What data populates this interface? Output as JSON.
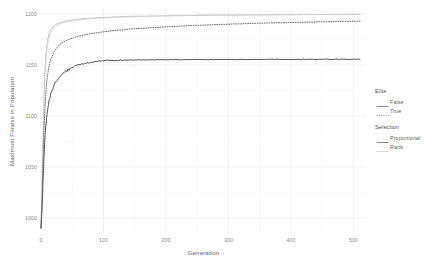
{
  "chart_data": {
    "type": "line",
    "title": "",
    "xlabel": "Generation",
    "ylabel": "Maximum Fitness in Population",
    "xlim": [
      0,
      520
    ],
    "ylim": [
      985,
      1205
    ],
    "xticks": [
      0,
      100,
      200,
      300,
      400,
      500
    ],
    "yticks": [
      1000,
      1050,
      1100,
      1150,
      1200
    ],
    "grid": true,
    "legend_position": "right",
    "legends": [
      {
        "title": "Elite",
        "entries": [
          {
            "label": "False",
            "style": "solid"
          },
          {
            "label": "True",
            "style": "dotted"
          }
        ]
      },
      {
        "title": "Selection",
        "entries": [
          {
            "label": "Proportional",
            "color": "#7a7a7a"
          },
          {
            "label": "Rank",
            "color": "#cfcfcf"
          }
        ]
      }
    ],
    "series": [
      {
        "name": "Rank / Elite=False",
        "elite": "False",
        "selection": "Rank",
        "style": "solid",
        "color": "#c8c8c8",
        "width": 1.0,
        "x": [
          0,
          1,
          2,
          3,
          4,
          5,
          6,
          7,
          8,
          9,
          10,
          12,
          14,
          16,
          18,
          20,
          24,
          28,
          32,
          36,
          40,
          50,
          60,
          70,
          80,
          90,
          100,
          120,
          140,
          160,
          180,
          200,
          240,
          280,
          320,
          360,
          400,
          440,
          480,
          510
        ],
        "y": [
          990,
          1012,
          1041,
          1072,
          1101,
          1124,
          1141,
          1153,
          1162,
          1168,
          1173,
          1179,
          1183,
          1185,
          1187,
          1188,
          1190,
          1191,
          1192,
          1192.6,
          1193.2,
          1194.2,
          1195,
          1195.6,
          1196,
          1196.4,
          1196.7,
          1197.2,
          1197.6,
          1197.9,
          1198.1,
          1198.4,
          1198.7,
          1199,
          1199.2,
          1199.3,
          1199.5,
          1199.6,
          1199.7,
          1199.8
        ]
      },
      {
        "name": "Rank / Elite=True",
        "elite": "True",
        "selection": "Rank",
        "style": "dotted",
        "color": "#cfcfcf",
        "width": 1.0,
        "x": [
          0,
          1,
          2,
          3,
          4,
          5,
          6,
          7,
          8,
          9,
          10,
          12,
          14,
          16,
          18,
          20,
          24,
          28,
          32,
          36,
          40,
          50,
          60,
          70,
          80,
          90,
          100,
          120,
          140,
          160,
          180,
          200,
          240,
          280,
          320,
          360,
          400,
          440,
          480,
          510
        ],
        "y": [
          990,
          1010,
          1037,
          1066,
          1094,
          1117,
          1134,
          1147,
          1156,
          1163,
          1168,
          1175,
          1179,
          1182,
          1184,
          1186,
          1188,
          1189.5,
          1190.6,
          1191.4,
          1192,
          1193.2,
          1194.1,
          1194.8,
          1195.3,
          1195.8,
          1196.2,
          1196.8,
          1197.3,
          1197.6,
          1197.9,
          1198.2,
          1198.6,
          1198.9,
          1199.1,
          1199.25,
          1199.4,
          1199.5,
          1199.6,
          1199.7
        ]
      },
      {
        "name": "Proportional / Elite=True",
        "elite": "True",
        "selection": "Proportional",
        "style": "dotted",
        "color": "#6f6f6f",
        "width": 1.0,
        "x": [
          0,
          1,
          2,
          3,
          4,
          5,
          6,
          7,
          8,
          9,
          10,
          12,
          14,
          16,
          18,
          20,
          24,
          28,
          32,
          36,
          40,
          50,
          60,
          70,
          80,
          90,
          100,
          120,
          140,
          160,
          180,
          200,
          240,
          280,
          320,
          360,
          400,
          440,
          480,
          510
        ],
        "y": [
          990,
          1005,
          1025,
          1048,
          1070,
          1089,
          1104,
          1116,
          1125,
          1132,
          1138,
          1146,
          1152,
          1156,
          1159,
          1162,
          1166,
          1169,
          1171,
          1172.6,
          1174,
          1176.4,
          1178.2,
          1179.6,
          1180.8,
          1181.8,
          1182.6,
          1184,
          1185.1,
          1186,
          1186.8,
          1187.5,
          1188.7,
          1189.7,
          1190.5,
          1191.2,
          1191.8,
          1192.3,
          1192.8,
          1193.1
        ]
      },
      {
        "name": "Proportional / Elite=False",
        "elite": "False",
        "selection": "Proportional",
        "style": "solid",
        "color": "#5a5a5a",
        "width": 1.0,
        "noisy": true,
        "x": [
          0,
          1,
          2,
          3,
          4,
          5,
          6,
          7,
          8,
          9,
          10,
          12,
          14,
          16,
          18,
          20,
          24,
          28,
          32,
          36,
          40,
          50,
          60,
          70,
          80,
          90,
          100,
          120,
          140,
          160,
          180,
          200,
          240,
          280,
          320,
          360,
          400,
          440,
          480,
          510
        ],
        "y": [
          990,
          1000,
          1014,
          1031,
          1048,
          1063,
          1075,
          1085,
          1093,
          1099,
          1104,
          1112,
          1118,
          1122,
          1126,
          1129,
          1134,
          1137,
          1140,
          1142,
          1144,
          1147.5,
          1150,
          1151.5,
          1152.8,
          1153.6,
          1154.2,
          1154.6,
          1154.9,
          1155,
          1155.1,
          1155.2,
          1155.3,
          1155.4,
          1155.4,
          1155.5,
          1155.5,
          1155.6,
          1155.6,
          1155.6
        ]
      }
    ]
  },
  "axis": {
    "y_title": "Maximum Fitness in Population",
    "x_title": "Generation",
    "y_tick_labels": [
      "1200",
      "1150",
      "1100",
      "1050",
      "1000"
    ],
    "x_tick_labels": [
      "0",
      "100",
      "200",
      "300",
      "400",
      "500"
    ]
  }
}
